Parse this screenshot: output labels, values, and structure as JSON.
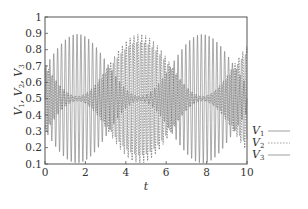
{
  "chart_data": {
    "type": "line",
    "title": "",
    "xlabel": "t",
    "ylabel": "V1, V2, V3",
    "xlim": [
      0,
      10
    ],
    "ylim": [
      0.1,
      1.0
    ],
    "x_ticks": [
      "0",
      "2",
      "4",
      "6",
      "8",
      "10"
    ],
    "y_ticks": [
      "0.1",
      "0.2",
      "0.3",
      "0.4",
      "0.5",
      "0.6",
      "0.7",
      "0.8",
      "0.9",
      "1"
    ],
    "grid": false,
    "legend_position": "right-outside-bottom",
    "series": [
      {
        "name": "V1",
        "style": "solid",
        "color": "#777777",
        "mean": 0.5,
        "carrier_frequency": 5.2,
        "envelope_period": 6.2,
        "envelope_peaks_t": [
          1.6,
          7.8
        ],
        "max_amplitude": 0.4
      },
      {
        "name": "V2",
        "style": "dashed",
        "color": "#555555",
        "mean": 0.5,
        "carrier_frequency": 5.2,
        "envelope_period": 6.2,
        "envelope_peaks_t": [
          4.7
        ],
        "max_amplitude": 0.4
      },
      {
        "name": "V3",
        "style": "solid",
        "color": "#999999",
        "mean": 0.5,
        "carrier_frequency": 5.2,
        "envelope_period": 6.2,
        "envelope_peaks_t": [
          -1.5,
          4.7,
          9.2
        ],
        "max_amplitude": 0.35
      }
    ]
  },
  "axes": {
    "xlabel": "t",
    "ylabel_parts": [
      "V",
      "1",
      ", V",
      "2",
      ", V",
      "3"
    ]
  },
  "legend": {
    "items": [
      {
        "label": "V",
        "sub": "1",
        "style": "solid"
      },
      {
        "label": "V",
        "sub": "2",
        "style": "dashed"
      },
      {
        "label": "V",
        "sub": "3",
        "style": "solid"
      }
    ]
  }
}
